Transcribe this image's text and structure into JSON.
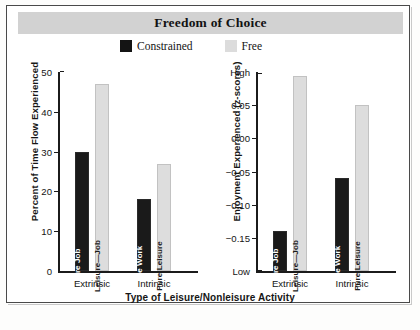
{
  "figure": {
    "title": "Freedom of Choice",
    "xlabel": "Type of Leisure/Nonleisure Activity"
  },
  "legend": {
    "items": [
      {
        "label": "Constrained",
        "color": "#141414"
      },
      {
        "label": "Free",
        "color": "#dcdcdc"
      }
    ]
  },
  "chart_data": [
    {
      "type": "bar",
      "title": "Freedom of Choice",
      "panel": "left",
      "ylabel": "Percent of Time Flow Experienced",
      "xlabel": "Type of Leisure/Nonleisure Activity",
      "categories": [
        "Extrinsic",
        "Intrinsic"
      ],
      "ylim": [
        0,
        50
      ],
      "yticks": [
        0,
        10,
        20,
        30,
        40,
        50
      ],
      "ytick_labels": [
        "0",
        "10",
        "20",
        "30",
        "40",
        "50"
      ],
      "grid": false,
      "legend_position": "top-center",
      "series": [
        {
          "name": "Constrained",
          "color": "#141414",
          "values": [
            30,
            18
          ]
        },
        {
          "name": "Free",
          "color": "#dcdcdc",
          "values": [
            47,
            27
          ]
        }
      ],
      "bars": [
        {
          "group": "Extrinsic",
          "series": "Constrained",
          "label": "Pure Job",
          "value": 30
        },
        {
          "group": "Extrinsic",
          "series": "Free",
          "label": "Leisure—Job",
          "value": 47
        },
        {
          "group": "Intrinsic",
          "series": "Constrained",
          "label": "Pure Work",
          "value": 18
        },
        {
          "group": "Intrinsic",
          "series": "Free",
          "label": "Pure Leisure",
          "value": 27
        }
      ]
    },
    {
      "type": "bar",
      "title": "Freedom of Choice",
      "panel": "right",
      "ylabel": "Enjoyment Experienced (z-scores)",
      "xlabel": "Type of Leisure/Nonleisure Activity",
      "categories": [
        "Extrinsic",
        "Intrinsic"
      ],
      "ylim": [
        -0.2,
        0.1
      ],
      "yticks": [
        0.1,
        0.05,
        0.0,
        -0.05,
        -0.1,
        -0.15,
        -0.2
      ],
      "ytick_labels": [
        "High",
        "0.05",
        "0.00",
        "−0.05",
        "−0.10",
        "−0.15",
        "Low"
      ],
      "grid": false,
      "legend_position": "top-center",
      "series": [
        {
          "name": "Constrained",
          "color": "#141414",
          "values": [
            -0.14,
            -0.06
          ]
        },
        {
          "name": "Free",
          "color": "#dcdcdc",
          "values": [
            0.094,
            0.05
          ]
        }
      ],
      "bars": [
        {
          "group": "Extrinsic",
          "series": "Constrained",
          "label": "Pure Job",
          "value": -0.14
        },
        {
          "group": "Extrinsic",
          "series": "Free",
          "label": "Leisure—Job",
          "value": 0.094
        },
        {
          "group": "Intrinsic",
          "series": "Constrained",
          "label": "Pure Work",
          "value": -0.06
        },
        {
          "group": "Intrinsic",
          "series": "Free",
          "label": "Pure Leisure",
          "value": 0.05
        }
      ]
    }
  ]
}
